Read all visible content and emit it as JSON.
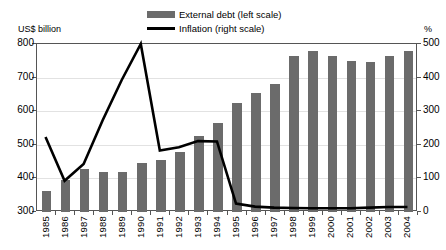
{
  "panel": {
    "title": "B. External debt and inflation"
  },
  "axes": {
    "left_unit": "US$ billion",
    "right_unit": "%",
    "left_ticks": [
      "800",
      "700",
      "600",
      "500",
      "400",
      "300"
    ],
    "right_ticks": [
      "500",
      "400",
      "300",
      "200",
      "100",
      "0"
    ]
  },
  "legend": {
    "items": [
      {
        "label": "External debt (left scale)",
        "marker": "bar-swatch",
        "color": "#6b6b6b"
      },
      {
        "label": "Inflation (right scale)",
        "marker": "line-swatch",
        "color": "#000000"
      }
    ]
  },
  "chart_data": {
    "type": "bar",
    "title": "B. External debt and inflation",
    "xlabel": "",
    "ylabel": "US$ billion",
    "y2label": "%",
    "ylim": [
      300,
      800
    ],
    "y2lim": [
      0,
      500
    ],
    "grid": true,
    "legend_position": "top-center",
    "categories": [
      "1985",
      "1986",
      "1987",
      "1988",
      "1989",
      "1990",
      "1991",
      "1992",
      "1993",
      "1994",
      "1995",
      "1996",
      "1997",
      "1998",
      "1999",
      "2000",
      "2001",
      "2002",
      "2003",
      "2004"
    ],
    "series": [
      {
        "name": "External debt (left scale)",
        "type": "bar",
        "axis": "left",
        "unit": "US$ billion",
        "color": "#6b6b6b",
        "values": [
          362,
          395,
          428,
          418,
          418,
          447,
          455,
          480,
          525,
          565,
          625,
          655,
          680,
          765,
          778,
          765,
          748,
          745,
          765,
          780
        ]
      },
      {
        "name": "Inflation (right scale)",
        "type": "line",
        "axis": "right",
        "unit": "%",
        "color": "#000000",
        "values": [
          220,
          90,
          140,
          270,
          390,
          497,
          180,
          190,
          208,
          207,
          22,
          13,
          10,
          9,
          8,
          8,
          8,
          10,
          12,
          12
        ]
      }
    ]
  }
}
